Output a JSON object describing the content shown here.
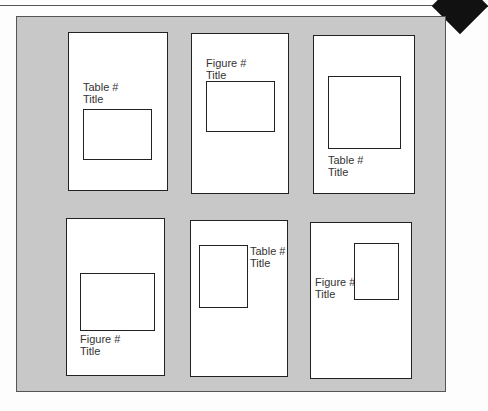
{
  "figure": {
    "colors": {
      "frame_background": "#c8c8c8",
      "page_background": "#ffffff",
      "border": "#222222"
    },
    "pages": [
      {
        "label": "Table #",
        "title": "Title",
        "caption_position": "above"
      },
      {
        "label": "Figure #",
        "title": "Title",
        "caption_position": "above"
      },
      {
        "label": "Table #",
        "title": "Title",
        "caption_position": "below"
      },
      {
        "label": "Figure #",
        "title": "Title",
        "caption_position": "below"
      },
      {
        "label": "Table #",
        "title": "Title",
        "caption_position": "right"
      },
      {
        "label": "Figure #",
        "title": "Title",
        "caption_position": "left"
      }
    ]
  }
}
